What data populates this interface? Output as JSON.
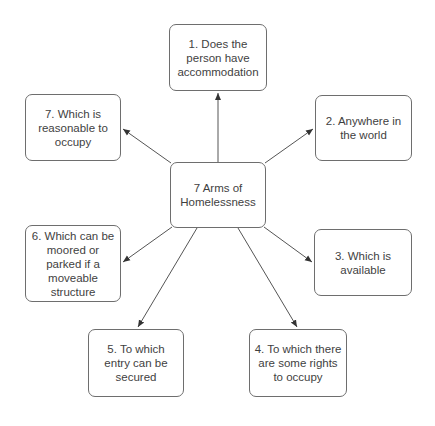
{
  "diagram": {
    "center": {
      "label": "7 Arms of Homelessness"
    },
    "arms": [
      {
        "id": 1,
        "label": "1. Does the person have accommodation"
      },
      {
        "id": 2,
        "label": "2. Anywhere in the world"
      },
      {
        "id": 3,
        "label": "3. Which is available"
      },
      {
        "id": 4,
        "label": "4. To which there are some rights to occupy"
      },
      {
        "id": 5,
        "label": "5. To which entry can be secured"
      },
      {
        "id": 6,
        "label": "6. Which can be moored or parked if a moveable structure"
      },
      {
        "id": 7,
        "label": "7. Which is reasonable to occupy"
      }
    ],
    "edges": [
      {
        "from": "center",
        "to": 1
      },
      {
        "from": "center",
        "to": 2
      },
      {
        "from": "center",
        "to": 3
      },
      {
        "from": "center",
        "to": 4
      },
      {
        "from": "center",
        "to": 5
      },
      {
        "from": "center",
        "to": 6
      },
      {
        "from": "center",
        "to": 7
      }
    ],
    "colors": {
      "border": "#6e6e6e",
      "text": "#3f3f3f",
      "line": "#555555",
      "background": "#ffffff"
    }
  }
}
